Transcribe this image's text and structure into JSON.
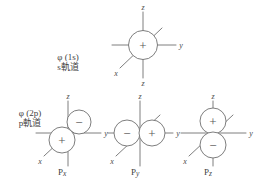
{
  "figure": {
    "background_color": "#ffffff",
    "stroke_color": "#6f6f6f",
    "text_color": "#3f3f3f"
  },
  "rows": [
    {
      "id": "s-row",
      "label_line1": "φ (1s)",
      "label_line2": "s軌道"
    },
    {
      "id": "p-row",
      "label_line1": "φ (2p)",
      "label_line2": "p軌道"
    }
  ],
  "axes": {
    "z_label": "z",
    "y_label": "y",
    "x_label": "x",
    "z_bottom_label": "z"
  },
  "signs": {
    "plus": "+",
    "minus": "−"
  },
  "orbitals": [
    {
      "id": "s-orbital",
      "caption": "",
      "caption_base": "",
      "caption_sub": "",
      "lobes": [
        {
          "sign": "+",
          "position": "center"
        }
      ]
    },
    {
      "id": "px-orbital",
      "caption": "Px",
      "caption_base": "P",
      "caption_sub": "x",
      "lobes": [
        {
          "sign": "+",
          "position": "lower-left"
        },
        {
          "sign": "−",
          "position": "upper-right"
        }
      ]
    },
    {
      "id": "py-orbital",
      "caption": "Py",
      "caption_base": "P",
      "caption_sub": "y",
      "lobes": [
        {
          "sign": "−",
          "position": "left"
        },
        {
          "sign": "+",
          "position": "right"
        }
      ]
    },
    {
      "id": "pz-orbital",
      "caption": "Pz",
      "caption_base": "P",
      "caption_sub": "z",
      "lobes": [
        {
          "sign": "+",
          "position": "top"
        },
        {
          "sign": "−",
          "position": "bottom"
        }
      ]
    }
  ]
}
